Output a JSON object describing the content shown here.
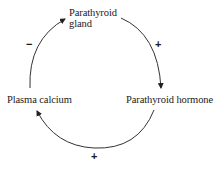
{
  "diagram": {
    "type": "feedback-loop",
    "nodes": [
      {
        "id": "gland",
        "label_line1": "Parathyroid",
        "label_line2": "gland"
      },
      {
        "id": "hormone",
        "label": "Parathyroid hormone"
      },
      {
        "id": "calcium",
        "label": "Plasma calcium"
      }
    ],
    "edges": [
      {
        "from": "gland",
        "to": "hormone",
        "sign": "+"
      },
      {
        "from": "hormone",
        "to": "calcium",
        "sign": "+"
      },
      {
        "from": "calcium",
        "to": "gland",
        "sign": "−"
      }
    ],
    "colors": {
      "stroke": "#333333",
      "text": "#1a1a1a",
      "background": "#ffffff"
    }
  }
}
